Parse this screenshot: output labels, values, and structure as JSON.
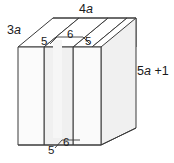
{
  "figure": {
    "background_color": "#ffffff",
    "outline_color": "#3a3a3a",
    "face_fill_front": "#fbfbfb",
    "face_fill_top": "#ffffff",
    "face_fill_side": "#f2f2f2",
    "face_fill_groove": "#ededed",
    "label_color": "#1a1a1a",
    "labels": {
      "depth": {
        "coefficient": "3",
        "variable": "a"
      },
      "width_top": {
        "coefficient": "4",
        "variable": "a"
      },
      "height_right": "5a +1",
      "height_right_parts": {
        "coefficient": "5",
        "variable": "a",
        "constant": "+1"
      },
      "groove_top_left": "5",
      "groove_top_middle": "6",
      "groove_top_right": "5",
      "groove_bottom_left": "5",
      "groove_bottom_middle": "6"
    }
  }
}
